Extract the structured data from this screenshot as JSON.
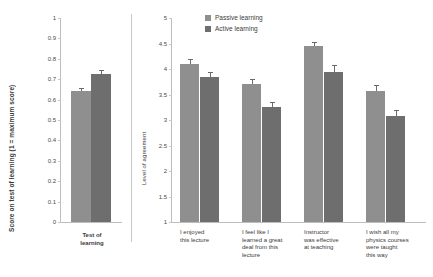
{
  "chart_data": [
    {
      "type": "bar",
      "panel": "left",
      "title": "",
      "xlabel": "",
      "ylabel": "Score on test of learning (1 = maximum score)",
      "ylim": [
        0,
        1
      ],
      "yticks": [
        "0",
        "0.1",
        "0.2",
        "0.3",
        "0.4",
        "0.5",
        "0.6",
        "0.7",
        "0.8",
        "0.9",
        "1"
      ],
      "grid": false,
      "categories": [
        "Test of\nlearning"
      ],
      "series": [
        {
          "name": "Passive learning",
          "color": "#8f8f8f",
          "values": [
            0.64
          ],
          "errors": [
            0.018
          ]
        },
        {
          "name": "Active learning",
          "color": "#6e6e6e",
          "values": [
            0.725
          ],
          "errors": [
            0.02
          ]
        }
      ]
    },
    {
      "type": "bar",
      "panel": "right",
      "title": "",
      "xlabel": "",
      "ylabel": "Level of agreement",
      "ylim": [
        1,
        5
      ],
      "yticks": [
        "1",
        "1.5",
        "2",
        "2.5",
        "3",
        "3.5",
        "4",
        "4.5",
        "5"
      ],
      "grid": false,
      "legend_position": "top-left",
      "categories": [
        "I enjoyed\nthis lecture",
        "I feel like I\nlearned a great\ndeal from this\nlecture",
        "Instructor\nwas effective\nat teaching",
        "I wish all my\nphysics courses\nwere taught\nthis way"
      ],
      "series": [
        {
          "name": "Passive learning",
          "color": "#8f8f8f",
          "values": [
            4.1,
            3.7,
            4.45,
            3.57
          ],
          "errors": [
            0.1,
            0.11,
            0.07,
            0.12
          ]
        },
        {
          "name": "Active learning",
          "color": "#6e6e6e",
          "values": [
            3.85,
            3.25,
            3.95,
            3.07
          ],
          "errors": [
            0.1,
            0.1,
            0.12,
            0.13
          ]
        }
      ]
    }
  ],
  "legend": {
    "items": [
      {
        "label": "Passive learning",
        "color": "#8f8f8f"
      },
      {
        "label": "Active learning",
        "color": "#6e6e6e"
      }
    ]
  }
}
